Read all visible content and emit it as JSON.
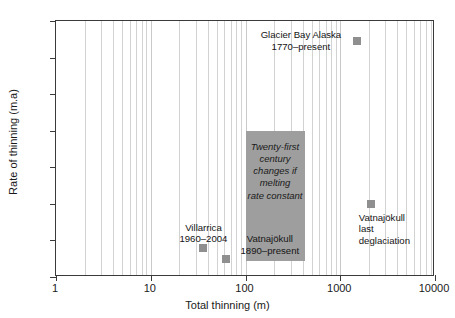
{
  "chart_data": {
    "type": "scatter",
    "title": "",
    "xlabel": "Total thinning (m)",
    "ylabel": "Rate of thinning (m.a)",
    "xscale": "log",
    "yscale": "linear",
    "xlim": [
      1,
      10000
    ],
    "ylim": [
      0,
      7
    ],
    "xticks": [
      "1",
      "10",
      "100",
      "1000",
      "10000"
    ],
    "xtick_values": [
      1,
      10,
      100,
      1000,
      10000
    ],
    "yticks": [
      "0",
      "1",
      "2",
      "3",
      "4",
      "5",
      "6",
      "7"
    ],
    "ytick_values": [
      0,
      1,
      2,
      3,
      4,
      5,
      6,
      7
    ],
    "grid": "vertical minor log gridlines",
    "legend": "none",
    "marker_color": "#8f8f8f",
    "points": [
      {
        "label": "Glacier Bay Alaska\n1770–present",
        "x": 1500,
        "y": 6.45,
        "label_position": "left"
      },
      {
        "label": "Villarrica\n1960–2004",
        "x": 36,
        "y": 0.8,
        "label_position": "above"
      },
      {
        "label": "Vatnajökull\n1890–present",
        "x": 62,
        "y": 0.48,
        "label_position": "above-right"
      },
      {
        "label": "Vatnajökull\nlast\ndeglaciation",
        "x": 2100,
        "y": 2.0,
        "label_position": "below"
      }
    ],
    "shaded_region": {
      "text": "Twenty-first\ncentury\nchanges if\nmelting\nrate constant",
      "x_range": [
        100,
        420
      ],
      "y_range": [
        0.45,
        4.0
      ],
      "color": "#9e9e9e"
    }
  },
  "axes": {
    "x_title": "Total thinning (m)",
    "y_title": "Rate of thinning (m.a)",
    "x_labels": [
      "1",
      "10",
      "100",
      "1000",
      "10000"
    ],
    "y_labels": [
      "0",
      "1",
      "2",
      "3",
      "4",
      "5",
      "6",
      "7"
    ]
  },
  "annotations": {
    "glacier_bay": "Glacier Bay Alaska\n1770–present",
    "villarrica": "Villarrica\n1960–2004",
    "vatnajokull_1890": "Vatnajökull\n1890–present",
    "vatnajokull_deglaciation": "Vatnajökull\nlast\ndeglaciation",
    "projection_box": "Twenty-first\ncentury\nchanges if\nmelting\nrate constant"
  },
  "colors": {
    "marker": "#8f8f8f",
    "box": "#9e9e9e",
    "axis": "#3a3a3a",
    "grid": "#d2d2d2",
    "text": "#141414"
  }
}
